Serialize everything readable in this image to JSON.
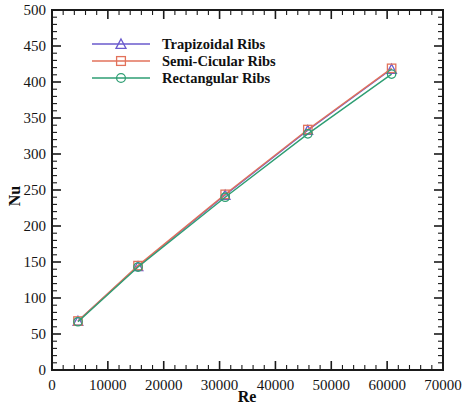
{
  "chart_data": {
    "type": "line",
    "title": "",
    "xlabel": "Re",
    "ylabel": "Nu",
    "xlim": [
      0,
      70000
    ],
    "ylim": [
      0,
      500
    ],
    "xticks": [
      0,
      10000,
      20000,
      30000,
      40000,
      50000,
      60000,
      70000
    ],
    "yticks": [
      0,
      50,
      100,
      150,
      200,
      250,
      300,
      350,
      400,
      450,
      500
    ],
    "xtick_labels": [
      "0",
      "10000",
      "20000",
      "30000",
      "40000",
      "50000",
      "60000",
      "70000"
    ],
    "ytick_labels": [
      "0",
      "50",
      "100",
      "150",
      "200",
      "250",
      "300",
      "350",
      "400",
      "450",
      "500"
    ],
    "x_minor_per_major": 5,
    "y_minor_per_major": 5,
    "grid": false,
    "legend_position": "upper left",
    "x": [
      4650,
      15400,
      31000,
      45800,
      60800
    ],
    "series": [
      {
        "name": "Trapizoidal Ribs",
        "label": "Trapizoidal Ribs",
        "color": "#6a5acd",
        "marker": "triangle",
        "values": [
          68,
          144,
          243,
          333,
          418
        ]
      },
      {
        "name": "Semi-Cicular Ribs",
        "label": "Semi-Cicular Ribs",
        "color": "#e2725b",
        "marker": "square",
        "values": [
          68,
          145,
          244,
          334,
          419
        ]
      },
      {
        "name": "Rectangular Ribs",
        "label": "Rectangular Ribs",
        "color": "#2e9e73",
        "marker": "circle",
        "values": [
          67,
          143,
          240,
          328,
          411
        ]
      }
    ]
  }
}
